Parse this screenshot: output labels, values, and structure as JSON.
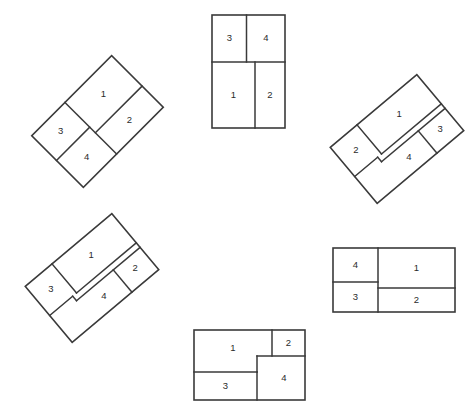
{
  "figure": {
    "background_color": "#ffffff",
    "line_color": "#3a3a3a",
    "label_color": "#2b2b2b",
    "canvas": {
      "width": 476,
      "height": 416
    },
    "region_labels": [
      "1",
      "2",
      "3",
      "4"
    ],
    "panels": [
      {
        "id": "panel-top-center",
        "name": "top-center-upright",
        "rotation_deg": 0,
        "center": {
          "x": 248.5,
          "y": 71.5
        },
        "width": 73,
        "height": 113,
        "regions": [
          {
            "label": "1",
            "x": 0.0,
            "y": 47.0,
            "w": 43.0,
            "h": 66.0,
            "cx": 21.5,
            "cy": 80.0
          },
          {
            "label": "2",
            "x": 43.0,
            "y": 47.0,
            "w": 30.0,
            "h": 66.0,
            "cx": 58.0,
            "cy": 80.0
          },
          {
            "label": "3",
            "x": 0.0,
            "y": 0.0,
            "w": 35.0,
            "h": 47.0,
            "cx": 17.5,
            "cy": 23.5
          },
          {
            "label": "4",
            "x": 35.0,
            "y": 0.0,
            "w": 38.0,
            "h": 47.0,
            "cx": 54.0,
            "cy": 23.5
          }
        ]
      },
      {
        "id": "panel-upper-left",
        "name": "upper-left-rotated",
        "rotation_deg": -45,
        "center": {
          "x": 97.5,
          "y": 121.5
        },
        "width": 113,
        "height": 73,
        "regions": [
          {
            "label": "1",
            "x": 47.0,
            "y": 0.0,
            "w": 66.0,
            "h": 43.0,
            "cx": 80.0,
            "cy": 21.5
          },
          {
            "label": "2",
            "x": 47.0,
            "y": 43.0,
            "w": 66.0,
            "h": 30.0,
            "cx": 80.0,
            "cy": 58.0
          },
          {
            "label": "3",
            "x": 0.0,
            "y": 0.0,
            "w": 47.0,
            "h": 35.0,
            "cx": 23.5,
            "cy": 17.5
          },
          {
            "label": "4",
            "x": 0.0,
            "y": 35.0,
            "w": 47.0,
            "h": 38.0,
            "cx": 23.5,
            "cy": 54.0
          }
        ]
      },
      {
        "id": "panel-upper-right",
        "name": "upper-right-rotated",
        "rotation_deg": -40,
        "center": {
          "x": 397.0,
          "y": 139.0
        },
        "width": 113,
        "height": 73,
        "regions": [
          {
            "label": "1",
            "x": 35.0,
            "y": 0.0,
            "w": 78.0,
            "h": 38.0,
            "cx": 74.0,
            "cy": 19.0
          },
          {
            "label": "2",
            "x": 0.0,
            "y": 0.0,
            "w": 35.0,
            "h": 38.0,
            "cx": 17.5,
            "cy": 19.0
          },
          {
            "label": "3",
            "x": 78.0,
            "y": 38.0,
            "w": 35.0,
            "h": 35.0,
            "cx": 95.5,
            "cy": 55.5
          },
          {
            "label": "4",
            "x": 30.0,
            "y": 38.0,
            "w": 48.0,
            "h": 35.0,
            "cx": 54.0,
            "cy": 55.5
          }
        ]
      },
      {
        "id": "panel-lower-left",
        "name": "lower-left-rotated",
        "rotation_deg": -40,
        "center": {
          "x": 92.0,
          "y": 278.0
        },
        "width": 113,
        "height": 73,
        "regions": [
          {
            "label": "1",
            "x": 35.0,
            "y": 0.0,
            "w": 78.0,
            "h": 38.0,
            "cx": 70.0,
            "cy": 19.0
          },
          {
            "label": "2",
            "x": 78.0,
            "y": 38.0,
            "w": 35.0,
            "h": 35.0,
            "cx": 95.5,
            "cy": 55.5
          },
          {
            "label": "3",
            "x": 0.0,
            "y": 0.0,
            "w": 35.0,
            "h": 38.0,
            "cx": 17.5,
            "cy": 19.0
          },
          {
            "label": "4",
            "x": 30.0,
            "y": 38.0,
            "w": 48.0,
            "h": 35.0,
            "cx": 54.0,
            "cy": 55.5
          }
        ]
      },
      {
        "id": "panel-lower-right",
        "name": "lower-right-upright",
        "rotation_deg": 0,
        "center": {
          "x": 394.0,
          "y": 280.0
        },
        "width": 122,
        "height": 64,
        "regions": [
          {
            "label": "1",
            "x": 45.0,
            "y": 0.0,
            "w": 77.0,
            "h": 40.0,
            "cx": 83.5,
            "cy": 20.0
          },
          {
            "label": "2",
            "x": 45.0,
            "y": 40.0,
            "w": 77.0,
            "h": 24.0,
            "cx": 83.5,
            "cy": 52.0
          },
          {
            "label": "3",
            "x": 0.0,
            "y": 34.0,
            "w": 45.0,
            "h": 30.0,
            "cx": 22.5,
            "cy": 49.0
          },
          {
            "label": "4",
            "x": 0.0,
            "y": 0.0,
            "w": 45.0,
            "h": 34.0,
            "cx": 22.5,
            "cy": 17.0
          }
        ]
      },
      {
        "id": "panel-bottom-center",
        "name": "bottom-center-upright",
        "rotation_deg": 0,
        "center": {
          "x": 249.5,
          "y": 365.0
        },
        "width": 111,
        "height": 70,
        "regions": [
          {
            "label": "1",
            "x": 0.0,
            "y": 0.0,
            "w": 78.0,
            "h": 37.0,
            "cx": 39.0,
            "cy": 18.5
          },
          {
            "label": "2",
            "x": 78.0,
            "y": 0.0,
            "w": 33.0,
            "h": 26.0,
            "cx": 94.5,
            "cy": 13.0
          },
          {
            "label": "3",
            "x": 0.0,
            "y": 42.0,
            "w": 63.0,
            "h": 28.0,
            "cx": 31.5,
            "cy": 56.0
          },
          {
            "label": "4",
            "x": 63.0,
            "y": 26.0,
            "w": 48.0,
            "h": 44.0,
            "cx": 90.0,
            "cy": 48.0
          }
        ]
      }
    ],
    "cut_paths": {
      "top-center": [
        "M 0 47 L 73 47",
        "M 34.5 0 L 34.5 47",
        "M 43 47 L 43 113"
      ],
      "upper-left": [
        "M 47 0 L 47 73",
        "M 47 35 L 0 35",
        "M 47 43 L 113 43"
      ],
      "upper-right": [
        "M 35 0 L 35 38",
        "M 0 38 L 30 38",
        "M 30 38 L 30 44",
        "M 30 44 L 113 44",
        "M 78 44 L 78 73",
        "M 35 38 L 113 38"
      ],
      "lower-left": [
        "M 35 0 L 35 38",
        "M 0 38 L 30 38",
        "M 30 38 L 30 44",
        "M 30 44 L 113 44",
        "M 78 44 L 78 73",
        "M 35 38 L 113 38"
      ],
      "lower-right": [
        "M 45 0 L 45 64",
        "M 0 34 L 45 34",
        "M 45 40 L 122 40"
      ],
      "bottom-center": [
        "M 0 42 L 63 42",
        "M 63 42 L 63 70",
        "M 63 26 L 111 26",
        "M 78 0 L 78 26",
        "M 63 26 L 63 42",
        "M 78 26 L 78 42"
      ]
    }
  }
}
